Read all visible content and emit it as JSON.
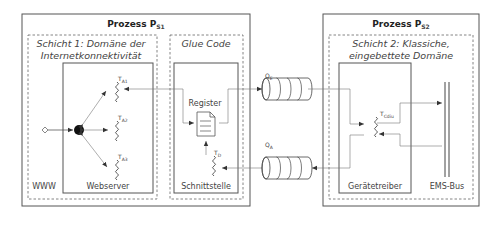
{
  "process_s1": {
    "title": "Prozess P",
    "title_sub": "S1",
    "layer1": {
      "title_line1": "Schicht 1: Domäne der",
      "title_line2": "Internetkonnektivität",
      "www_label": "WWW",
      "webserver": {
        "label": "Webserver",
        "threads": [
          {
            "label": "T",
            "sub": "A1"
          },
          {
            "label": "T",
            "sub": "A2"
          },
          {
            "label": "T",
            "sub": "A3"
          }
        ]
      }
    },
    "glue_code": {
      "title": "Glue Code",
      "interface_label": "Schnittstelle",
      "register_label": "Register",
      "thread": {
        "label": "T",
        "sub": "D"
      }
    }
  },
  "queues": [
    {
      "label": "Q",
      "sub": "E"
    },
    {
      "label": "Q",
      "sub": "A"
    }
  ],
  "process_s2": {
    "title": "Prozess P",
    "title_sub": "S2",
    "layer2": {
      "title_line1": "Schicht 2: Klassiche,",
      "title_line2": "eingebettete Domäne",
      "driver": {
        "label": "Gerätetreiber",
        "thread": {
          "label": "T",
          "sub": "Cdiu"
        }
      },
      "bus_label": "EMS-Bus"
    }
  },
  "colors": {
    "stroke": "#444444",
    "light_stroke": "#777777",
    "dot": "#111111"
  }
}
